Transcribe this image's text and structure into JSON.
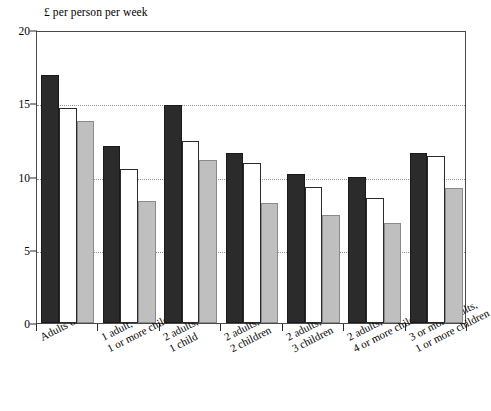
{
  "chart_data": {
    "type": "bar",
    "title": "",
    "ylabel": "£ per person per week",
    "xlabel": "",
    "ylim": [
      0,
      20
    ],
    "yticks": [
      0,
      5,
      10,
      15,
      20
    ],
    "ytick_labels": [
      "0",
      "5",
      "10",
      "15",
      "20"
    ],
    "grid": "horizontal-dotted",
    "legend": "none",
    "categories": [
      "Adults only",
      "1 adult,\n1 or more children",
      "2 adults,\n1 child",
      "2 adults,\n2 children",
      "2 adults,\n3 children",
      "2 adults,\n4 or more children",
      "3 or more adults,\n1 or more children"
    ],
    "series": [
      {
        "name": "series-1",
        "color": "#2b2b2b",
        "values": [
          16.9,
          12.1,
          14.9,
          11.6,
          10.2,
          10.0,
          11.6
        ]
      },
      {
        "name": "series-2",
        "color": "#ffffff",
        "values": [
          14.7,
          10.5,
          12.4,
          10.9,
          9.3,
          8.5,
          11.4
        ]
      },
      {
        "name": "series-3",
        "color": "#bfbfbf",
        "values": [
          13.8,
          8.3,
          11.1,
          8.2,
          7.4,
          6.8,
          9.2
        ]
      }
    ]
  }
}
